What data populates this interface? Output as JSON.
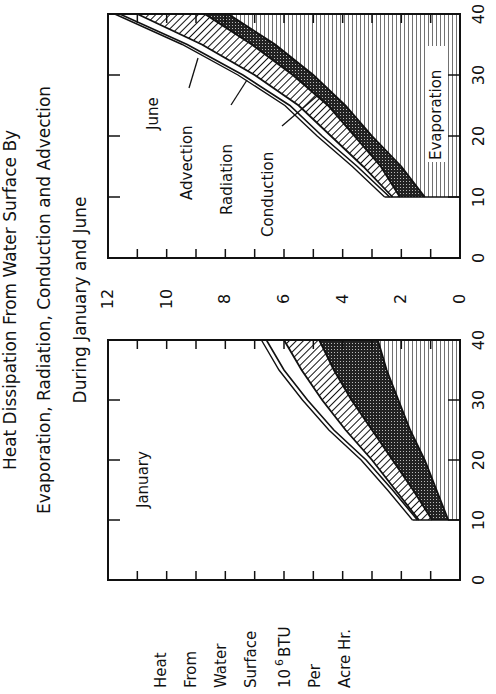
{
  "title_lines": [
    "Heat Dissipation From Water Surface By",
    "Evaporation, Radiation, Conduction and Advection",
    "During January and June"
  ],
  "ylabel_lines": [
    "Heat",
    "From",
    "Water",
    "Surface",
    "10 6 BTU",
    "Per",
    "Acre Hr."
  ],
  "ylabel_unit": {
    "base": "10",
    "exp": "6",
    "unit": "BTU"
  },
  "colors": {
    "ink": "#111111",
    "background": "#ffffff"
  },
  "chart_data": [
    {
      "type": "area",
      "title": "June",
      "xlabel": "",
      "ylabel": "Heat From Water Surface 10^6 BTU Per Acre Hr.",
      "x": [
        10,
        15,
        20,
        25,
        30,
        35,
        40
      ],
      "xlim": [
        0,
        40
      ],
      "ylim": [
        0,
        12
      ],
      "xticks": [
        "0",
        "10",
        "20",
        "30",
        "40"
      ],
      "yticks": [
        "0",
        "2",
        "4",
        "6",
        "8",
        "10",
        "12"
      ],
      "stacked_upper_boundaries": true,
      "series": [
        {
          "name": "Evaporation",
          "pattern": "horizontal-lines",
          "values": [
            1.2,
            2.0,
            3.0,
            3.9,
            5.0,
            6.3,
            7.9
          ]
        },
        {
          "name": "Conduction",
          "pattern": "cross-hatch",
          "values": [
            2.05,
            2.7,
            3.6,
            4.5,
            5.7,
            7.1,
            8.7
          ]
        },
        {
          "name": "Radiation",
          "pattern": "diagonal-lines",
          "values": [
            2.3,
            3.3,
            4.4,
            5.5,
            7.0,
            8.8,
            11.0
          ]
        },
        {
          "name": "Advection",
          "pattern": "blank",
          "values": [
            2.4,
            3.5,
            4.7,
            5.8,
            7.4,
            9.3,
            11.6
          ]
        }
      ],
      "annotations": [
        "June",
        "Advection",
        "Radiation",
        "Conduction",
        "Evaporation"
      ]
    },
    {
      "type": "area",
      "title": "January",
      "xlabel": "",
      "ylabel": "Heat From Water Surface 10^6 BTU Per Acre Hr.",
      "x": [
        10,
        15,
        20,
        25,
        30,
        35,
        40
      ],
      "xlim": [
        0,
        40
      ],
      "ylim": [
        0,
        12
      ],
      "xticks": [
        "0",
        "10",
        "20",
        "30",
        "40"
      ],
      "yticks": [
        "0",
        "2",
        "4",
        "6",
        "8",
        "10",
        "12"
      ],
      "stacked_upper_boundaries": true,
      "series": [
        {
          "name": "Evaporation",
          "pattern": "horizontal-lines",
          "values": [
            0.4,
            0.8,
            1.2,
            1.7,
            2.1,
            2.5,
            2.8
          ]
        },
        {
          "name": "Conduction",
          "pattern": "cross-hatch",
          "values": [
            0.95,
            1.6,
            2.3,
            3.0,
            3.7,
            4.3,
            4.8
          ]
        },
        {
          "name": "Radiation",
          "pattern": "diagonal-lines",
          "values": [
            1.4,
            2.2,
            3.0,
            3.9,
            4.7,
            5.4,
            6.0
          ]
        },
        {
          "name": "Advection",
          "pattern": "blank",
          "values": [
            1.45,
            2.3,
            3.2,
            4.3,
            5.2,
            6.0,
            6.6
          ]
        }
      ],
      "annotations": [
        "January"
      ]
    }
  ]
}
